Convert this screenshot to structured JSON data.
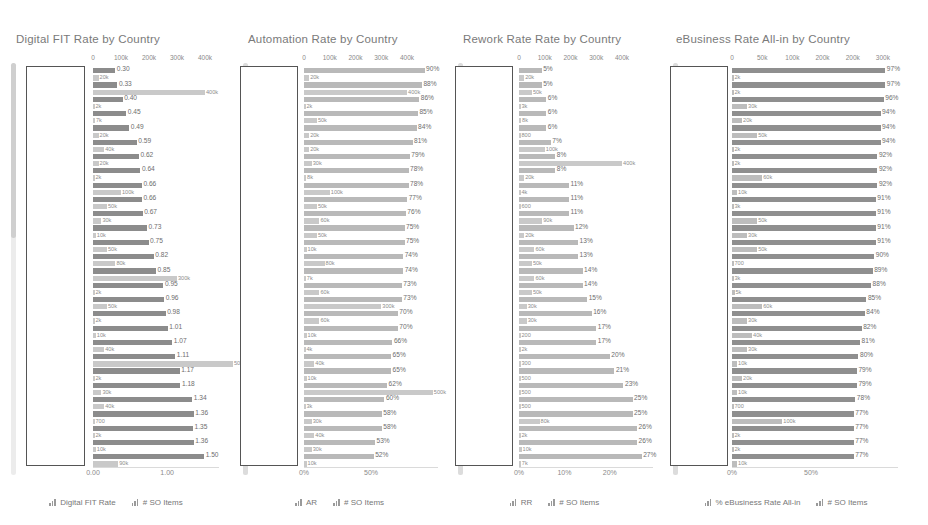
{
  "legend_labels": {
    "so_items": "# SO Items"
  },
  "chart_data": [
    {
      "type": "bar",
      "title": "Digital FIT Rate by Country",
      "orientation": "horizontal",
      "grid": false,
      "legend_position": "bottom",
      "legend": [
        "Digital FIT Rate",
        "# SO Items"
      ],
      "top_axis": {
        "label": "",
        "ticks": [
          "0",
          "100k",
          "200k",
          "300k",
          "400k"
        ],
        "range": [
          0,
          450000
        ]
      },
      "bottom_axis": {
        "label": "",
        "ticks": [
          "0.00",
          "1.00"
        ],
        "range": [
          0,
          1.7
        ]
      },
      "series": [
        {
          "name": "Digital FIT Rate",
          "axis": "bottom",
          "values": [
            0.3,
            0.33,
            0.4,
            0.45,
            0.49,
            0.59,
            0.62,
            0.64,
            0.66,
            0.66,
            0.67,
            0.73,
            0.75,
            0.82,
            0.85,
            0.95,
            0.96,
            0.98,
            1.01,
            1.07,
            1.11,
            1.17,
            1.18,
            1.34,
            1.36,
            1.35,
            1.36,
            1.5
          ],
          "labels": [
            "0.30",
            "0.33",
            "0.40",
            "0.45",
            "0.49",
            "0.59",
            "0.62",
            "0.64",
            "0.66",
            "0.66",
            "0.67",
            "0.73",
            "0.75",
            "0.82",
            "0.85",
            "0.95",
            "0.96",
            "0.98",
            "1.01",
            "1.07",
            "1.11",
            "1.17",
            "1.18",
            "1.34",
            "1.36",
            "1.35",
            "1.36",
            "1.50"
          ]
        },
        {
          "name": "# SO Items",
          "axis": "top",
          "values": [
            20000,
            400000,
            2000,
            7000,
            20000,
            40000,
            20000,
            2000,
            100000,
            50000,
            30000,
            10000,
            50000,
            80000,
            300000,
            2000,
            50000,
            2000,
            10000,
            40000,
            500000,
            2000,
            30000,
            40000,
            700,
            2000,
            10000,
            90000
          ],
          "labels": [
            "20k",
            "400k",
            "2k",
            "7k",
            "20k",
            "40k",
            "20k",
            "2k",
            "100k",
            "50k",
            "30k",
            "10k",
            "50k",
            "80k",
            "300k",
            "2k",
            "50k",
            "2k",
            "10k",
            "40k",
            "500k",
            "2k",
            "30k",
            "40k",
            "700",
            "2k",
            "10k",
            "90k"
          ]
        }
      ]
    },
    {
      "type": "bar",
      "title": "Automation Rate by Country",
      "orientation": "horizontal",
      "grid": false,
      "legend_position": "bottom",
      "legend": [
        "AR",
        "# SO Items"
      ],
      "top_axis": {
        "label": "",
        "ticks": [
          "0",
          "100k",
          "200k",
          "300k",
          "400k"
        ],
        "range": [
          0,
          520000
        ]
      },
      "bottom_axis": {
        "label": "",
        "ticks": [
          "0%",
          "50%"
        ],
        "range": [
          0,
          1.0
        ]
      },
      "series": [
        {
          "name": "AR",
          "axis": "bottom",
          "values": [
            0.9,
            0.88,
            0.86,
            0.85,
            0.84,
            0.81,
            0.79,
            0.78,
            0.78,
            0.77,
            0.76,
            0.75,
            0.75,
            0.74,
            0.74,
            0.73,
            0.73,
            0.7,
            0.7,
            0.66,
            0.65,
            0.65,
            0.62,
            0.6,
            0.58,
            0.58,
            0.53,
            0.52
          ],
          "labels": [
            "90%",
            "88%",
            "86%",
            "85%",
            "84%",
            "81%",
            "79%",
            "78%",
            "78%",
            "77%",
            "76%",
            "75%",
            "75%",
            "74%",
            "74%",
            "73%",
            "73%",
            "70%",
            "70%",
            "66%",
            "65%",
            "65%",
            "62%",
            "60%",
            "58%",
            "58%",
            "53%",
            "52%"
          ]
        },
        {
          "name": "# SO Items",
          "axis": "top",
          "values": [
            20000,
            400000,
            2000,
            50000,
            20000,
            20000,
            30000,
            8000,
            100000,
            50000,
            60000,
            50000,
            10000,
            80000,
            7000,
            60000,
            300000,
            60000,
            10000,
            4000,
            40000,
            10000,
            500000,
            3000,
            30000,
            40000,
            30000,
            10000
          ],
          "labels": [
            "20k",
            "400k",
            "2k",
            "50k",
            "20k",
            "20k",
            "30k",
            "8k",
            "100k",
            "50k",
            "60k",
            "50k",
            "10k",
            "80k",
            "7k",
            "60k",
            "300k",
            "60k",
            "10k",
            "4k",
            "40k",
            "10k",
            "500k",
            "3k",
            "30k",
            "40k",
            "30k",
            "10k"
          ]
        }
      ]
    },
    {
      "type": "bar",
      "title": "Rework Rate Rate by Country",
      "orientation": "horizontal",
      "grid": false,
      "legend_position": "bottom",
      "legend": [
        "RR",
        "# SO Items"
      ],
      "top_axis": {
        "label": "",
        "ticks": [
          "0",
          "100k",
          "200k",
          "300k",
          "400k"
        ],
        "range": [
          0,
          520000
        ]
      },
      "bottom_axis": {
        "label": "",
        "ticks": [
          "0%",
          "10%",
          "20%"
        ],
        "range": [
          0,
          0.295
        ]
      },
      "series": [
        {
          "name": "RR",
          "axis": "bottom",
          "values": [
            0.05,
            0.05,
            0.06,
            0.06,
            0.06,
            0.07,
            0.08,
            0.08,
            0.11,
            0.11,
            0.11,
            0.12,
            0.13,
            0.13,
            0.14,
            0.14,
            0.15,
            0.16,
            0.17,
            0.17,
            0.2,
            0.21,
            0.23,
            0.25,
            0.25,
            0.26,
            0.26,
            0.27
          ],
          "labels": [
            "5%",
            "5%",
            "6%",
            "6%",
            "6%",
            "7%",
            "8%",
            "8%",
            "11%",
            "11%",
            "11%",
            "12%",
            "13%",
            "13%",
            "14%",
            "14%",
            "15%",
            "16%",
            "17%",
            "17%",
            "20%",
            "21%",
            "23%",
            "25%",
            "25%",
            "26%",
            "26%",
            "27%"
          ]
        },
        {
          "name": "# SO Items",
          "axis": "top",
          "values": [
            20000,
            50000,
            3000,
            8000,
            800,
            100000,
            400000,
            20000,
            4000,
            600,
            90000,
            20000,
            60000,
            50000,
            60000,
            50000,
            30000,
            30000,
            200,
            2000,
            300,
            500,
            500,
            500,
            80000,
            2000,
            10000,
            7000
          ],
          "labels": [
            "20k",
            "50k",
            "3k",
            "8k",
            "800",
            "100k",
            "400k",
            "20k",
            "4k",
            "600",
            "90k",
            "20k",
            "60k",
            "50k",
            "60k",
            "50k",
            "30k",
            "30k",
            "200",
            "2k",
            "300",
            "500",
            "500",
            "500",
            "80k",
            "2k",
            "10k",
            "7k"
          ]
        }
      ]
    },
    {
      "type": "bar",
      "title": "eBusiness Rate All-in by Country",
      "orientation": "horizontal",
      "grid": false,
      "legend_position": "bottom",
      "legend": [
        "% eBusiness Rate All-in",
        "# SO Items"
      ],
      "top_axis": {
        "label": "",
        "ticks": [
          "0",
          "50k",
          "100k",
          "200k",
          "200k",
          "300k"
        ],
        "range": [
          0,
          330000
        ]
      },
      "bottom_axis": {
        "label": "",
        "ticks": [
          "0%",
          "50%"
        ],
        "range": [
          0,
          1.05
        ]
      },
      "series": [
        {
          "name": "% eBusiness Rate All-in",
          "axis": "bottom",
          "values": [
            0.97,
            0.97,
            0.96,
            0.94,
            0.94,
            0.94,
            0.92,
            0.92,
            0.92,
            0.91,
            0.91,
            0.91,
            0.91,
            0.9,
            0.89,
            0.88,
            0.85,
            0.84,
            0.82,
            0.81,
            0.8,
            0.79,
            0.79,
            0.78,
            0.77,
            0.77,
            0.77,
            0.77
          ],
          "labels": [
            "97%",
            "97%",
            "96%",
            "94%",
            "94%",
            "94%",
            "92%",
            "92%",
            "92%",
            "91%",
            "91%",
            "91%",
            "91%",
            "90%",
            "89%",
            "88%",
            "85%",
            "84%",
            "82%",
            "81%",
            "80%",
            "79%",
            "79%",
            "78%",
            "77%",
            "77%",
            "77%",
            "77%"
          ]
        },
        {
          "name": "# SO Items",
          "axis": "top",
          "values": [
            2000,
            2000,
            30000,
            20000,
            50000,
            2000,
            2000,
            60000,
            10000,
            3000,
            50000,
            30000,
            50000,
            700,
            3000,
            5000,
            60000,
            30000,
            40000,
            30000,
            10000,
            20000,
            10000,
            700,
            100000,
            2000,
            2000,
            10000
          ],
          "labels": [
            "2k",
            "2k",
            "30k",
            "20k",
            "50k",
            "2k",
            "2k",
            "60k",
            "10k",
            "3k",
            "50k",
            "30k",
            "50k",
            "700",
            "3k",
            "5k",
            "60k",
            "30k",
            "40k",
            "30k",
            "10k",
            "20k",
            "10k",
            "700",
            "100k",
            "2k",
            "2k",
            "10k"
          ]
        }
      ]
    }
  ]
}
